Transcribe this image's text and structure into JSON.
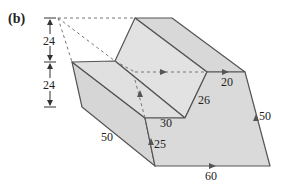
{
  "panel_label": "(b)",
  "colors": {
    "face_fill": "#dcdcdc",
    "face_fill_light": "#e6e6e6",
    "edge": "#555555",
    "dashed": "#777777",
    "text": "#222222",
    "arrow": "#555555"
  },
  "dimensions": {
    "upper_height": "24",
    "lower_height": "24"
  },
  "edge_labels": {
    "ridge_right": "20",
    "inner_slant": "26",
    "inner_bottom": "30",
    "front_left_slant": "50",
    "vertical_flow": "25",
    "right_side": "50",
    "bottom": "60"
  }
}
